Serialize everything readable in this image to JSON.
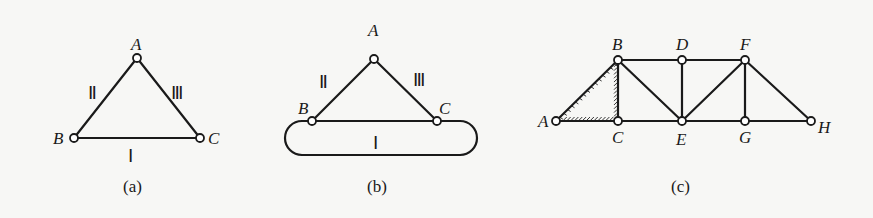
{
  "figures": [
    {
      "id": "a",
      "caption": "(a)",
      "nodes": [
        "A",
        "B",
        "C"
      ],
      "bodies": [
        {
          "label": "Ⅰ",
          "member": "BC"
        },
        {
          "label": "Ⅱ",
          "member": "AB"
        },
        {
          "label": "Ⅲ",
          "member": "AC"
        }
      ]
    },
    {
      "id": "b",
      "caption": "(b)",
      "nodes": [
        "A",
        "B",
        "C"
      ],
      "bodies": [
        {
          "label": "Ⅰ",
          "member": "rigid rounded body BC"
        },
        {
          "label": "Ⅱ",
          "member": "AB"
        },
        {
          "label": "Ⅲ",
          "member": "AC"
        }
      ]
    },
    {
      "id": "c",
      "caption": "(c)",
      "nodes": [
        "A",
        "B",
        "C",
        "D",
        "E",
        "F",
        "G",
        "H"
      ],
      "members": [
        "AB",
        "AC",
        "BC",
        "BD",
        "BE",
        "CE",
        "DE",
        "DF",
        "EF",
        "EG",
        "FG",
        "FH",
        "GH"
      ],
      "hatched_triangle": "ABC"
    }
  ]
}
